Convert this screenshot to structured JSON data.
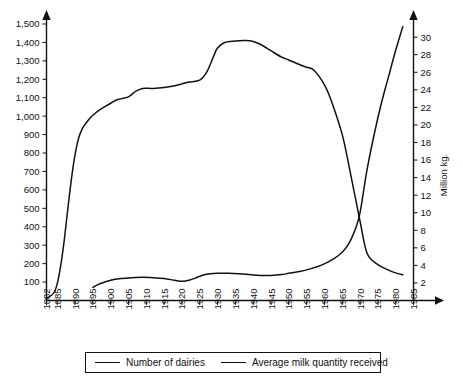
{
  "chart_data": {
    "type": "line",
    "title": "",
    "subtitle": "",
    "xlabel": "",
    "ylabel": "",
    "ylabel_right": "Million kg.",
    "grid": false,
    "legend_position": "bottom",
    "xlim": [
      1882,
      1985
    ],
    "x_ticks": [
      "1882",
      "1885",
      "1890",
      "1895",
      "1900",
      "1905",
      "1910",
      "1915",
      "1920",
      "1925",
      "1930",
      "1935",
      "1940",
      "1945",
      "1950",
      "1955",
      "1960",
      "1965",
      "1970",
      "1975",
      "1980",
      "1985"
    ],
    "left_axis": {
      "ylim": [
        0,
        1500
      ],
      "ticks": [
        "100",
        "200",
        "300",
        "400",
        "500",
        "600",
        "700",
        "800",
        "900",
        "1,000",
        "1,100",
        "1,200",
        "1,300",
        "1,400",
        "1,500"
      ],
      "tick_values": [
        100,
        200,
        300,
        400,
        500,
        600,
        700,
        800,
        900,
        1000,
        1100,
        1200,
        1300,
        1400,
        1500
      ]
    },
    "right_axis": {
      "ylim": [
        0,
        31.5
      ],
      "label": "Million kg.",
      "ticks": [
        "2",
        "4",
        "6",
        "8",
        "10",
        "12",
        "14",
        "16",
        "18",
        "20",
        "22",
        "24",
        "26",
        "28",
        "30"
      ],
      "tick_values": [
        2,
        4,
        6,
        8,
        10,
        12,
        14,
        16,
        18,
        20,
        22,
        24,
        26,
        28,
        30
      ]
    },
    "series": [
      {
        "name": "Number of dairies",
        "axis": "left",
        "x": [
          1882,
          1884,
          1885,
          1886,
          1887,
          1888,
          1889,
          1890,
          1891,
          1892,
          1893,
          1894,
          1895,
          1897,
          1900,
          1902,
          1905,
          1907,
          1909,
          1910,
          1912,
          1915,
          1918,
          1920,
          1922,
          1925,
          1927,
          1929,
          1930,
          1932,
          1935,
          1938,
          1940,
          1942,
          1945,
          1948,
          1950,
          1953,
          1955,
          1957,
          1960,
          1962,
          1965,
          1967,
          1970,
          1972,
          1975,
          1978,
          1980,
          1982
        ],
        "values": [
          10,
          40,
          90,
          190,
          330,
          500,
          660,
          790,
          880,
          930,
          960,
          985,
          1005,
          1035,
          1070,
          1090,
          1105,
          1135,
          1150,
          1152,
          1150,
          1155,
          1165,
          1175,
          1185,
          1195,
          1240,
          1330,
          1370,
          1400,
          1408,
          1410,
          1405,
          1390,
          1355,
          1320,
          1305,
          1280,
          1265,
          1250,
          1170,
          1080,
          900,
          720,
          430,
          255,
          195,
          165,
          150,
          140
        ]
      },
      {
        "name": "Average milk quantity received",
        "axis": "right",
        "x": [
          1895,
          1897,
          1900,
          1903,
          1906,
          1909,
          1912,
          1915,
          1918,
          1920,
          1922,
          1924,
          1926,
          1928,
          1930,
          1933,
          1936,
          1939,
          1942,
          1945,
          1948,
          1950,
          1953,
          1956,
          1959,
          1962,
          1965,
          1967,
          1969,
          1970,
          1971,
          1972,
          1974,
          1976,
          1978,
          1980,
          1982
        ],
        "values": [
          1.5,
          1.9,
          2.3,
          2.5,
          2.6,
          2.65,
          2.6,
          2.5,
          2.3,
          2.2,
          2.3,
          2.6,
          2.9,
          3.05,
          3.1,
          3.1,
          3.05,
          2.95,
          2.85,
          2.85,
          2.95,
          3.1,
          3.3,
          3.6,
          4.0,
          4.6,
          5.5,
          6.6,
          8.5,
          10.0,
          12.5,
          15.0,
          19.0,
          22.5,
          25.5,
          28.5,
          31.2
        ]
      }
    ],
    "legend": [
      {
        "label": "Number of dairies"
      },
      {
        "label": "Average milk quantity received"
      }
    ]
  }
}
